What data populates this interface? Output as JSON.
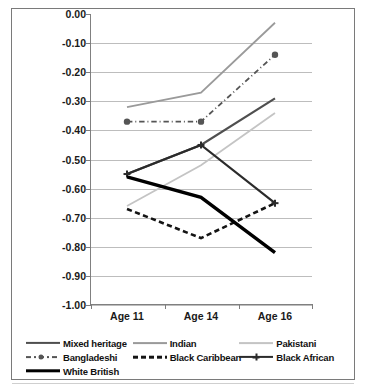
{
  "title": "",
  "axes": {
    "ylabel": "Mean normal score",
    "yticks": [
      "0.00",
      "-0.10",
      "-0.20",
      "-0.30",
      "-0.40",
      "-0.50",
      "-0.60",
      "-0.70",
      "-0.80",
      "-0.90",
      "-1.00"
    ],
    "xticks": [
      "Age 11",
      "Age 14",
      "Age 16"
    ]
  },
  "legend": {
    "items": [
      {
        "label": "Mixed heritage",
        "style": "solid",
        "color": "#4f4f4f",
        "width": 2.2,
        "marker": "none"
      },
      {
        "label": "Indian",
        "style": "solid",
        "color": "#9a9a9a",
        "width": 1.8,
        "marker": "none"
      },
      {
        "label": "Pakistani",
        "style": "solid",
        "color": "#c4c4c4",
        "width": 1.8,
        "marker": "none"
      },
      {
        "label": "Bangladeshi",
        "style": "dashdot",
        "color": "#555555",
        "width": 1.8,
        "marker": "circle"
      },
      {
        "label": "Black Caribbean",
        "style": "dashed",
        "color": "#141414",
        "width": 2.6,
        "marker": "none"
      },
      {
        "label": "Black African",
        "style": "solid",
        "color": "#2b2b2b",
        "width": 2.2,
        "marker": "plus"
      },
      {
        "label": "White British",
        "style": "solid",
        "color": "#000000",
        "width": 3.4,
        "marker": "none"
      }
    ]
  },
  "chart_data": {
    "type": "line",
    "title": "",
    "xlabel": "",
    "ylabel": "Mean normal score",
    "categories": [
      "Age 11",
      "Age 14",
      "Age 16"
    ],
    "ylim": [
      -1.0,
      0.0
    ],
    "ytick_step": 0.1,
    "grid": true,
    "legend_position": "bottom",
    "series": [
      {
        "name": "Mixed heritage",
        "values": [
          -0.55,
          -0.45,
          -0.29
        ],
        "color": "#4f4f4f",
        "style": "solid",
        "marker": "none"
      },
      {
        "name": "Indian",
        "values": [
          -0.32,
          -0.27,
          -0.03
        ],
        "color": "#9a9a9a",
        "style": "solid",
        "marker": "none"
      },
      {
        "name": "Pakistani",
        "values": [
          -0.66,
          -0.52,
          -0.34
        ],
        "color": "#c4c4c4",
        "style": "solid",
        "marker": "none"
      },
      {
        "name": "Bangladeshi",
        "values": [
          -0.37,
          -0.37,
          -0.14
        ],
        "color": "#555555",
        "style": "dashdot",
        "marker": "circle"
      },
      {
        "name": "Black Caribbean",
        "values": [
          -0.67,
          -0.77,
          -0.65
        ],
        "color": "#141414",
        "style": "dashed",
        "marker": "none"
      },
      {
        "name": "Black African",
        "values": [
          -0.55,
          -0.45,
          -0.65
        ],
        "color": "#2b2b2b",
        "style": "solid",
        "marker": "plus"
      },
      {
        "name": "White British",
        "values": [
          -0.56,
          -0.63,
          -0.82
        ],
        "color": "#000000",
        "style": "solid",
        "marker": "none"
      }
    ]
  }
}
